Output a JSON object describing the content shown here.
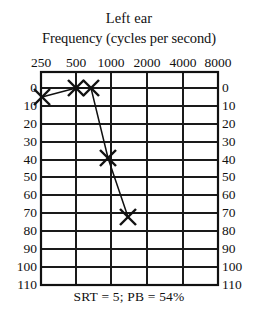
{
  "figure": {
    "title": "Left ear",
    "axis_title": "Frequency (cycles per second)",
    "caption": "SRT = 5; PB = 54%"
  },
  "chart_data": {
    "type": "line",
    "title": "Left ear",
    "xlabel": "Frequency (cycles per second)",
    "ylabel": "",
    "x_tick_labels": [
      "250",
      "500",
      "1000",
      "2000",
      "4000",
      "8000"
    ],
    "x_tick_values": [
      250,
      500,
      1000,
      2000,
      4000,
      8000
    ],
    "y_tick_labels": [
      "0",
      "10",
      "20",
      "30",
      "40",
      "50",
      "60",
      "70",
      "80",
      "90",
      "100",
      "110"
    ],
    "y_tick_values": [
      0,
      10,
      20,
      30,
      40,
      50,
      60,
      70,
      80,
      90,
      100,
      110
    ],
    "ylim": [
      0,
      110
    ],
    "y_inverted": true,
    "grid": true,
    "legend": "none",
    "marker": "x",
    "series": [
      {
        "name": "Left ear air conduction",
        "marker": "x",
        "points": [
          {
            "frequency": 250,
            "hearing_level": 5
          },
          {
            "frequency": 500,
            "hearing_level": 0
          },
          {
            "frequency": 750,
            "hearing_level": 0
          },
          {
            "frequency": 1500,
            "hearing_level": 40
          },
          {
            "frequency": 3000,
            "hearing_level": 70
          }
        ]
      }
    ],
    "annotations": [
      "SRT = 5; PB = 54%"
    ]
  },
  "x_ticks": [
    {
      "label": "250",
      "px": 41
    },
    {
      "label": "500",
      "px": 76
    },
    {
      "label": "1000",
      "px": 111
    },
    {
      "label": "2000",
      "px": 147
    },
    {
      "label": "4000",
      "px": 183
    },
    {
      "label": "8000",
      "px": 218
    }
  ],
  "y_ticks": [
    {
      "label": "0",
      "px": 16
    },
    {
      "label": "10",
      "px": 34
    },
    {
      "label": "20",
      "px": 52
    },
    {
      "label": "30",
      "px": 70
    },
    {
      "label": "40",
      "px": 88
    },
    {
      "label": "50",
      "px": 105
    },
    {
      "label": "60",
      "px": 123
    },
    {
      "label": "70",
      "px": 141
    },
    {
      "label": "80",
      "px": 159
    },
    {
      "label": "90",
      "px": 177
    },
    {
      "label": "100",
      "px": 195
    },
    {
      "label": "110",
      "px": 213
    }
  ],
  "plot": {
    "vertical_gridlines_px": [
      0,
      35,
      70,
      106,
      142,
      177
    ],
    "horizontal_gridlines_px": [
      16,
      34,
      52,
      70,
      88,
      105,
      123,
      141,
      159,
      177,
      195
    ],
    "markers_px": [
      {
        "cx": 1,
        "cy": 25,
        "label": "250 Hz, 5 dB"
      },
      {
        "cx": 35,
        "cy": 16,
        "label": "500 Hz, 0 dB"
      },
      {
        "cx": 50,
        "cy": 16,
        "label": "750 Hz, 0 dB"
      },
      {
        "cx": 67,
        "cy": 86,
        "label": "1500 Hz, 40 dB"
      },
      {
        "cx": 87,
        "cy": 145,
        "label": "3000 Hz, 70 dB"
      }
    ],
    "polyline_px": "1,25 35,16 50,16 67,86 87,145"
  },
  "colors": {
    "ink": "#111111",
    "background": "#ffffff",
    "gridline": "#1a1a1a"
  }
}
